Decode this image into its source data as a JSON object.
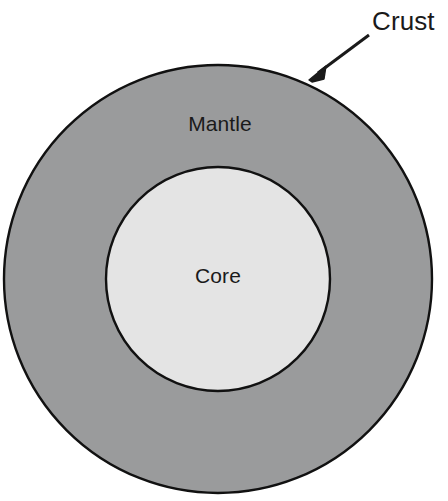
{
  "diagram": {
    "background_color": "#ffffff",
    "stroke_color": "#111111",
    "layers": [
      {
        "id": "mantle",
        "label": "Mantle",
        "fill_color": "#9a9b9c",
        "label_x": 220,
        "label_y": 125,
        "center_x": 218,
        "center_y": 279,
        "radius": 214
      },
      {
        "id": "core",
        "label": "Core",
        "fill_color": "#e4e4e4",
        "label_x": 218,
        "label_y": 277,
        "center_x": 218,
        "center_y": 279,
        "radius": 112
      }
    ],
    "callouts": [
      {
        "id": "crust",
        "label": "Crust",
        "label_x": 372,
        "label_y": 30,
        "arrow_start_x": 369,
        "arrow_start_y": 35,
        "arrow_end_x": 311,
        "arrow_end_y": 78,
        "color": "#1a1a1a"
      }
    ]
  }
}
